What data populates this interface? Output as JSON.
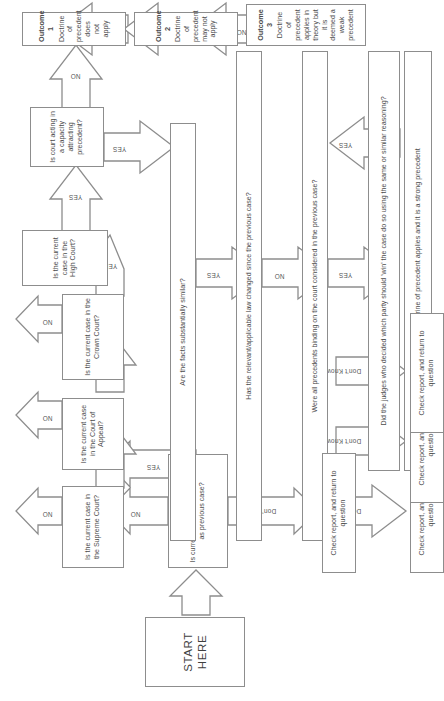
{
  "diagram": {
    "start": {
      "label": "START HERE"
    },
    "questions": [
      {
        "id": "q-same-court",
        "text": "Is current case in the same court as previous case?"
      },
      {
        "id": "q-supreme",
        "text": "Is the current case in the Supreme Court?"
      },
      {
        "id": "q-court-of-appeal",
        "text": "Is the current case in the Court of Appeal?"
      },
      {
        "id": "q-crown",
        "text": "Is the current case in the Crown Court?"
      },
      {
        "id": "q-high",
        "text": "Is the current case in the High Court?"
      },
      {
        "id": "q-capacity",
        "text": "Is court acting in a capacity attracting precedent?"
      },
      {
        "id": "q-facts",
        "text": "Are the facts substantially similar?"
      },
      {
        "id": "q-law-changed",
        "text": "Has the relevant/applicable law changed since the previous case?"
      },
      {
        "id": "q-precedents-binding",
        "text": "Were all precedents binding on the court considered in the previous case?"
      },
      {
        "id": "q-same-reasoning",
        "text": "Did the judges who decided which party should 'win' the case do so using the same or similar reasoning?"
      }
    ],
    "outcomes": [
      {
        "id": "outcome-1",
        "title": "Outcome 1",
        "text": "Doctrine of precedent does not apply"
      },
      {
        "id": "outcome-2",
        "title": "Outcome 2",
        "text": "Doctrine of precedent may not apply"
      },
      {
        "id": "outcome-3",
        "title": "Outcome 3",
        "text": "Doctrine of precedent applies in theory but it is deemed a weak precedent"
      },
      {
        "id": "outcome-4",
        "title": "Outcome 4",
        "text": "Doctrine of precedent applies and it is a strong precedent"
      }
    ],
    "check_boxes": [
      {
        "id": "check-1",
        "text": "Check report, and return to question"
      },
      {
        "id": "check-2",
        "text": "Check report, and return to question"
      },
      {
        "id": "check-3",
        "text": "Check report, and return to question"
      },
      {
        "id": "check-4",
        "text": "Check report, and return to question"
      }
    ],
    "edge_labels": {
      "yes": "YES",
      "no": "NO",
      "dont_know": "Don't Know"
    },
    "edges": [
      {
        "from": "q-same-court",
        "to": "q-supreme",
        "label": "NO"
      },
      {
        "from": "q-same-court",
        "to": "q-facts",
        "label": "YES"
      },
      {
        "from": "q-same-court",
        "to": "check-1",
        "label": "Don't Know"
      },
      {
        "from": "q-supreme",
        "to": "q-court-of-appeal",
        "label": "NO"
      },
      {
        "from": "q-supreme",
        "to": "q-facts",
        "label": "YES"
      },
      {
        "from": "q-court-of-appeal",
        "to": "q-crown",
        "label": "NO"
      },
      {
        "from": "q-court-of-appeal",
        "to": "q-facts",
        "label": "YES"
      },
      {
        "from": "q-crown",
        "to": "q-high",
        "label": "NO"
      },
      {
        "from": "q-crown",
        "to": "q-facts",
        "label": "YES"
      },
      {
        "from": "q-high",
        "to": "q-capacity",
        "label": "YES"
      },
      {
        "from": "q-capacity",
        "to": "outcome-1",
        "label": "NO"
      },
      {
        "from": "q-capacity",
        "to": "q-facts",
        "label": "YES"
      },
      {
        "from": "q-facts",
        "to": "q-law-changed",
        "label": "YES"
      },
      {
        "from": "q-facts",
        "to": "check-2",
        "label": "Don't Know"
      },
      {
        "from": "q-law-changed",
        "to": "outcome-1",
        "label": "YES"
      },
      {
        "from": "q-law-changed",
        "to": "q-precedents-binding",
        "label": "NO"
      },
      {
        "from": "q-law-changed",
        "to": "check-3",
        "label": "Don't Know"
      },
      {
        "from": "q-precedents-binding",
        "to": "outcome-2",
        "label": "NO"
      },
      {
        "from": "q-precedents-binding",
        "to": "q-same-reasoning",
        "label": "YES"
      },
      {
        "from": "q-precedents-binding",
        "to": "check-4",
        "label": "Don't Know"
      },
      {
        "from": "q-same-reasoning",
        "to": "outcome-3",
        "label": "NO"
      },
      {
        "from": "q-same-reasoning",
        "to": "outcome-4",
        "label": "YES"
      }
    ],
    "colors": {
      "stroke": "#8d8d8d",
      "text": "#4c4c4c",
      "background": "#ffffff"
    }
  }
}
